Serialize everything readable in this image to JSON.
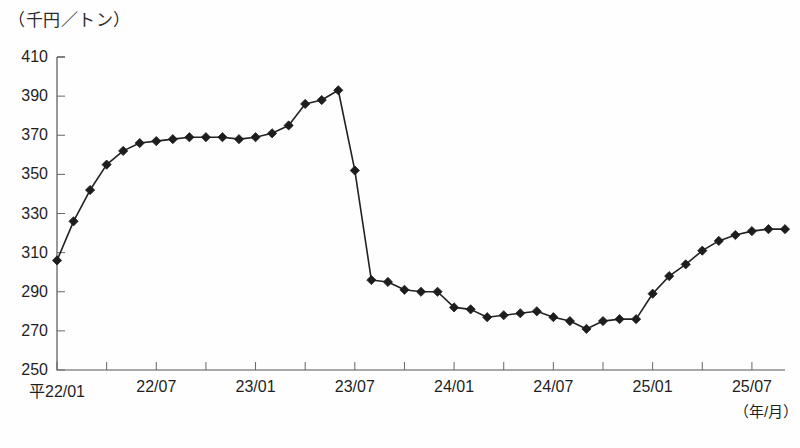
{
  "chart_data": {
    "type": "line",
    "title": "",
    "subtitle": "",
    "ylabel": "（千円／トン）",
    "xlabel": "（年/月）",
    "ylim": [
      250,
      410
    ],
    "ytick_step": 20,
    "yticks": [
      "410",
      "390",
      "370",
      "350",
      "330",
      "310",
      "290",
      "270",
      "250"
    ],
    "xticks": [
      "平22/01",
      "22/07",
      "23/01",
      "23/07",
      "24/01",
      "24/07",
      "25/01",
      "25/07"
    ],
    "xtick_index": [
      0,
      6,
      12,
      18,
      24,
      30,
      36,
      42
    ],
    "grid": false,
    "legend": "none",
    "marker": "diamond",
    "series": [
      {
        "name": "価格",
        "x": [
          "平22/01",
          "平22/02",
          "平22/03",
          "平22/04",
          "平22/05",
          "平22/06",
          "22/07",
          "22/08",
          "22/09",
          "22/10",
          "22/11",
          "22/12",
          "23/01",
          "23/02",
          "23/03",
          "23/04",
          "23/05",
          "23/06",
          "23/07",
          "23/08",
          "23/09",
          "23/10",
          "23/11",
          "23/12",
          "24/01",
          "24/02",
          "24/03",
          "24/04",
          "24/05",
          "24/06",
          "24/07",
          "24/08",
          "24/09",
          "24/10",
          "24/11",
          "24/12",
          "25/01",
          "25/02",
          "25/03",
          "25/04",
          "25/05",
          "25/06",
          "25/07",
          "25/08",
          "25/09"
        ],
        "values": [
          306,
          326,
          342,
          355,
          362,
          366,
          367,
          368,
          369,
          369,
          369,
          368,
          369,
          371,
          375,
          386,
          388,
          393,
          352,
          296,
          295,
          291,
          290,
          290,
          282,
          281,
          277,
          278,
          279,
          280,
          277,
          275,
          271,
          275,
          276,
          276,
          289,
          298,
          304,
          311,
          316,
          319,
          321,
          322,
          322
        ]
      }
    ]
  },
  "axis": {
    "plot_left": 57,
    "plot_right": 785,
    "plot_top": 57,
    "plot_bottom": 370
  },
  "footnote": {
    "text": ""
  }
}
